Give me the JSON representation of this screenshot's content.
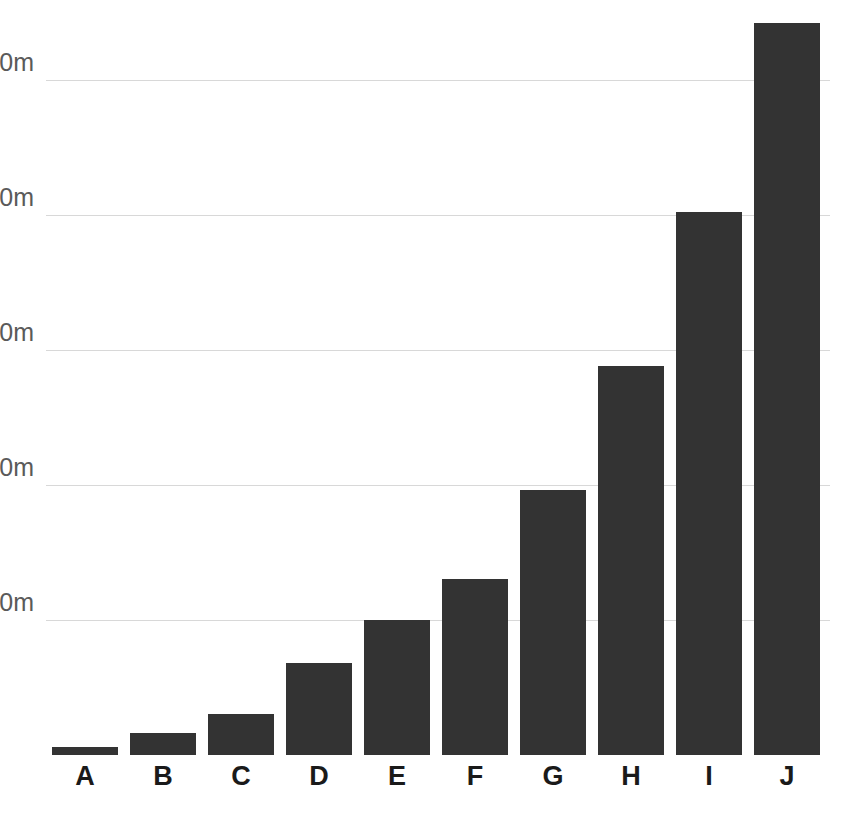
{
  "chart_data": {
    "type": "bar",
    "title": "",
    "subtitle": "",
    "xlabel": "",
    "ylabel": "",
    "categories": [
      "A",
      "B",
      "C",
      "D",
      "E",
      "F",
      "G",
      "H",
      "I",
      "J"
    ],
    "values": [
      3,
      8,
      15,
      34,
      50,
      65,
      98,
      144,
      201,
      271
    ],
    "value_unit": "m",
    "ylim": [
      0,
      280
    ],
    "y_ticks": [
      50,
      100,
      150,
      200,
      250
    ],
    "y_tick_labels": [
      "50m",
      "100m",
      "150m",
      "200m",
      "250m"
    ],
    "grid": true,
    "grid_axis": "y",
    "legend": false,
    "legend_position": "none",
    "series": [
      {
        "name": "",
        "values": [
          3,
          8,
          15,
          34,
          50,
          65,
          98,
          144,
          201,
          271
        ]
      }
    ],
    "colors": {
      "bar": "#333333",
      "gridline": "#d8d8d8",
      "background": "#ffffff",
      "y_tick_text": "#5a5a5a",
      "x_tick_text": "#1a1a1a"
    }
  }
}
